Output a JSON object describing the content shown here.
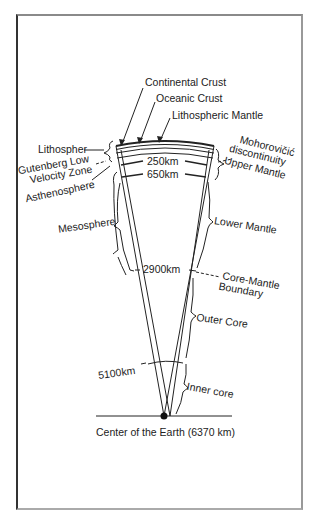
{
  "diagram": {
    "labels": {
      "continental_crust": "Continental Crust",
      "oceanic_crust": "Oceanic Crust",
      "lithospheric_mantle": "Lithospheric Mantle",
      "lithosphere": "Lithospher",
      "gutenberg_low_1": "Gutenberg Low",
      "gutenberg_low_2": "Velocity Zone",
      "asthenosphere": "Asthenosphere",
      "mohorovicic_1": "Mohorovičić",
      "mohorovicic_2": "discontinuity",
      "upper_mantle": "Upper Mantle",
      "mesosphere": "Mesosphere",
      "lower_mantle": "Lower Mantle",
      "core_mantle_1": "Core-Mantle",
      "core_mantle_2": "Boundary",
      "outer_core": "Outer Core",
      "inner_core": "Inner core",
      "center": "Center of the Earth (6370 km)"
    },
    "depths": {
      "d250": "250km",
      "d650": "650km",
      "d2900": "2900km",
      "d5100": "5100km"
    },
    "colors": {
      "line": "#222222",
      "background": "#ffffff"
    }
  }
}
